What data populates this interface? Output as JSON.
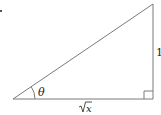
{
  "diagram": {
    "type": "right-triangle",
    "labels": {
      "angle": "θ",
      "opposite": "1",
      "adjacent_radicand": "x",
      "adjacent": "√x"
    },
    "colors": {
      "stroke": "#7a7a7a",
      "text": "#222222",
      "background": "#ffffff"
    },
    "marks": {
      "right_angle": "bottom-right",
      "angle_arc": "bottom-left"
    }
  }
}
